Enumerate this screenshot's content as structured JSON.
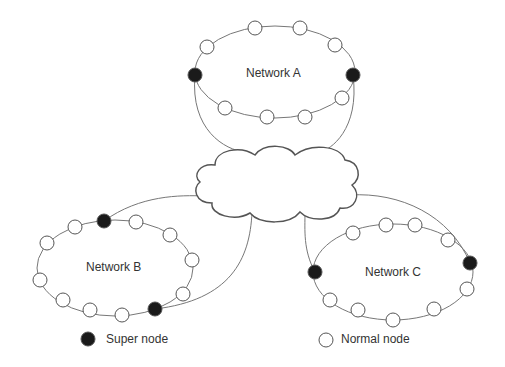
{
  "networks": {
    "a": {
      "label": "Network A"
    },
    "b": {
      "label": "Network B"
    },
    "c": {
      "label": "Network C"
    }
  },
  "legend": {
    "super_node": "Super node",
    "normal_node": "Normal node"
  },
  "colors": {
    "super_node_fill": "#1a1a1a",
    "normal_node_fill": "#ffffff",
    "stroke": "#555555"
  }
}
